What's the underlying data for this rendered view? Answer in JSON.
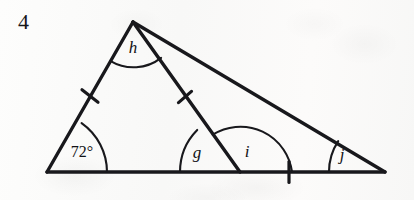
{
  "question": {
    "number": "4"
  },
  "figure": {
    "type": "triangle-with-cevian",
    "stroke_color": "#18181c",
    "background_color": "#fbfbfa",
    "vertices": {
      "apex": {
        "x": 133,
        "y": 22,
        "name": "apex-vertex"
      },
      "bottom_left": {
        "x": 47,
        "y": 172,
        "name": "bottom-left-vertex"
      },
      "bottom_right": {
        "x": 385,
        "y": 172,
        "name": "bottom-right-vertex"
      },
      "cevian_foot": {
        "x": 240,
        "y": 172,
        "name": "cevian-foot-vertex"
      }
    },
    "angles": [
      {
        "id": "bottom-left",
        "label": "72°",
        "x": 82,
        "y": 152,
        "italic": false
      },
      {
        "id": "apex",
        "label": "h",
        "x": 133,
        "y": 48,
        "italic": true
      },
      {
        "id": "cevian-left",
        "label": "g",
        "x": 197,
        "y": 153,
        "italic": true
      },
      {
        "id": "cevian-right",
        "label": "i",
        "x": 247,
        "y": 152,
        "italic": true
      },
      {
        "id": "bottom-right",
        "label": "j",
        "x": 342,
        "y": 155,
        "italic": true
      }
    ],
    "tick_marks": [
      {
        "id": "left-side-tick",
        "x": 90,
        "y": 96,
        "segment": "apex-to-bottom-left"
      },
      {
        "id": "cevian-tick",
        "x": 185,
        "y": 97,
        "segment": "apex-to-cevian-foot"
      },
      {
        "id": "base-right-tick",
        "x": 289,
        "y": 172,
        "segment": "cevian-foot-to-bottom-right"
      }
    ],
    "equal_segment_groups": [
      [
        "apex-to-bottom-left",
        "apex-to-cevian-foot",
        "cevian-foot-to-bottom-right"
      ]
    ]
  }
}
